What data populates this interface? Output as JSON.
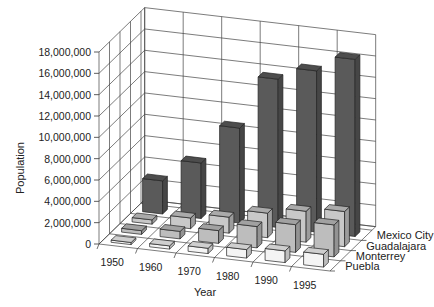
{
  "chart_data": {
    "type": "bar",
    "subtype": "3d-bar",
    "title": "",
    "xlabel": "Year",
    "ylabel": "Population",
    "categories": [
      "1950",
      "1960",
      "1970",
      "1980",
      "1990",
      "1995"
    ],
    "series": [
      {
        "name": "Mexico City",
        "values": [
          3100000,
          5200000,
          8900000,
          13900000,
          15100000,
          16600000
        ],
        "color": "#5a5a5a"
      },
      {
        "name": "Guadalajara",
        "values": [
          400000,
          1000000,
          1500000,
          2300000,
          2900000,
          3300000
        ],
        "color": "#c8c8c8"
      },
      {
        "name": "Monterrey",
        "values": [
          350000,
          700000,
          1200000,
          2000000,
          2600000,
          3000000
        ],
        "color": "#bdbdbd"
      },
      {
        "name": "Puebla",
        "values": [
          200000,
          300000,
          500000,
          800000,
          1100000,
          1200000
        ],
        "color": "#f4f4f4"
      }
    ],
    "yticks": [
      "0",
      "2,000,000",
      "4,000,000",
      "6,000,000",
      "8,000,000",
      "10,000,000",
      "12,000,000",
      "14,000,000",
      "16,000,000",
      "18,000,000"
    ],
    "ylim": [
      0,
      18000000
    ],
    "grid": true,
    "legend_position": "depth-axis-labels-right"
  }
}
